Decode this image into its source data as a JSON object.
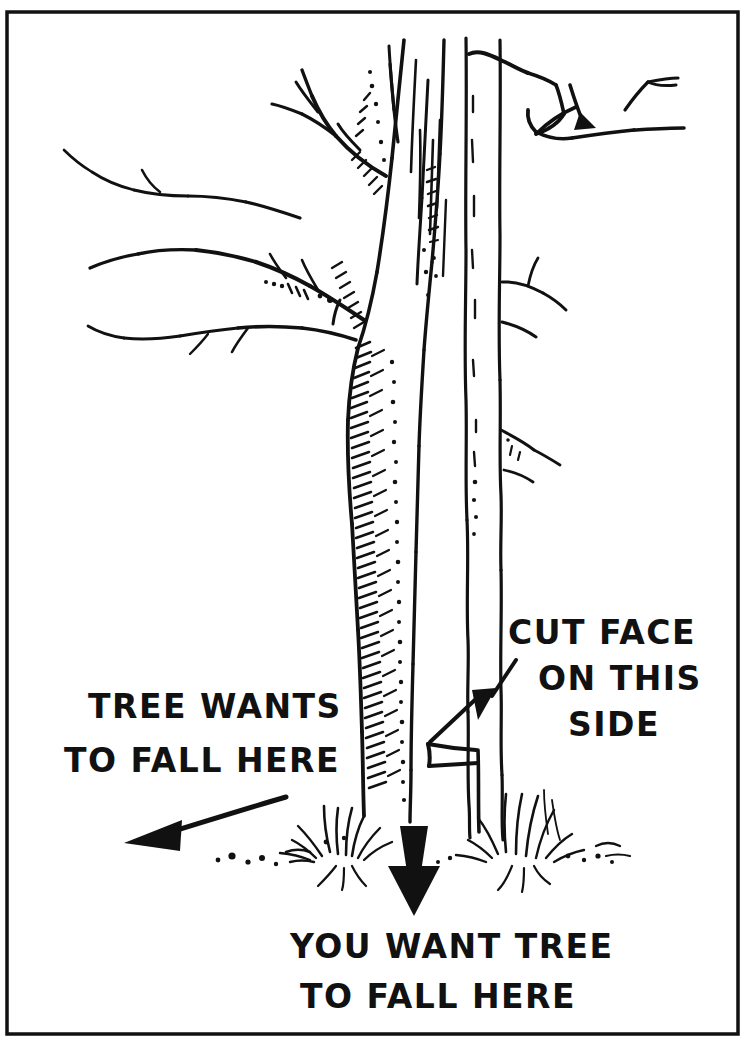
{
  "figure": {
    "kind": "line-drawing",
    "background_color": "#ffffff",
    "ink_color": "#111111",
    "border": {
      "present": true,
      "style": "thin rectangular rule",
      "color": "#111111"
    }
  },
  "labels": {
    "tree_wants": {
      "line1": "TREE WANTS",
      "line2": "TO FALL HERE"
    },
    "cut_face": {
      "line1": "CUT FACE",
      "line2": "ON THIS",
      "line3": "SIDE"
    },
    "you_want": {
      "line1": "YOU WANT TREE",
      "line2": "TO FALL HERE"
    }
  },
  "annotations": {
    "arrow_left": {
      "name": "left-arrow",
      "points_to": "left",
      "meaning": "natural lean / direction tree wants to fall"
    },
    "arrow_down": {
      "name": "down-arrow",
      "points_to": "down",
      "meaning": "desired felling direction toward viewer"
    },
    "arrow_to_notch": {
      "name": "notch-pointer-arrow",
      "points_to": "down-left",
      "meaning": "indicates the cut face / notch on the trunk"
    }
  },
  "scene": {
    "foreground_tree": "leaning deciduous tree with bark hatching, branching left",
    "background_tree": "slender bare tree trunk with notch cut",
    "notch": "wedge cut face on the near side of the trunk",
    "ground": "grass tufts and scattered debris at the tree bases"
  }
}
